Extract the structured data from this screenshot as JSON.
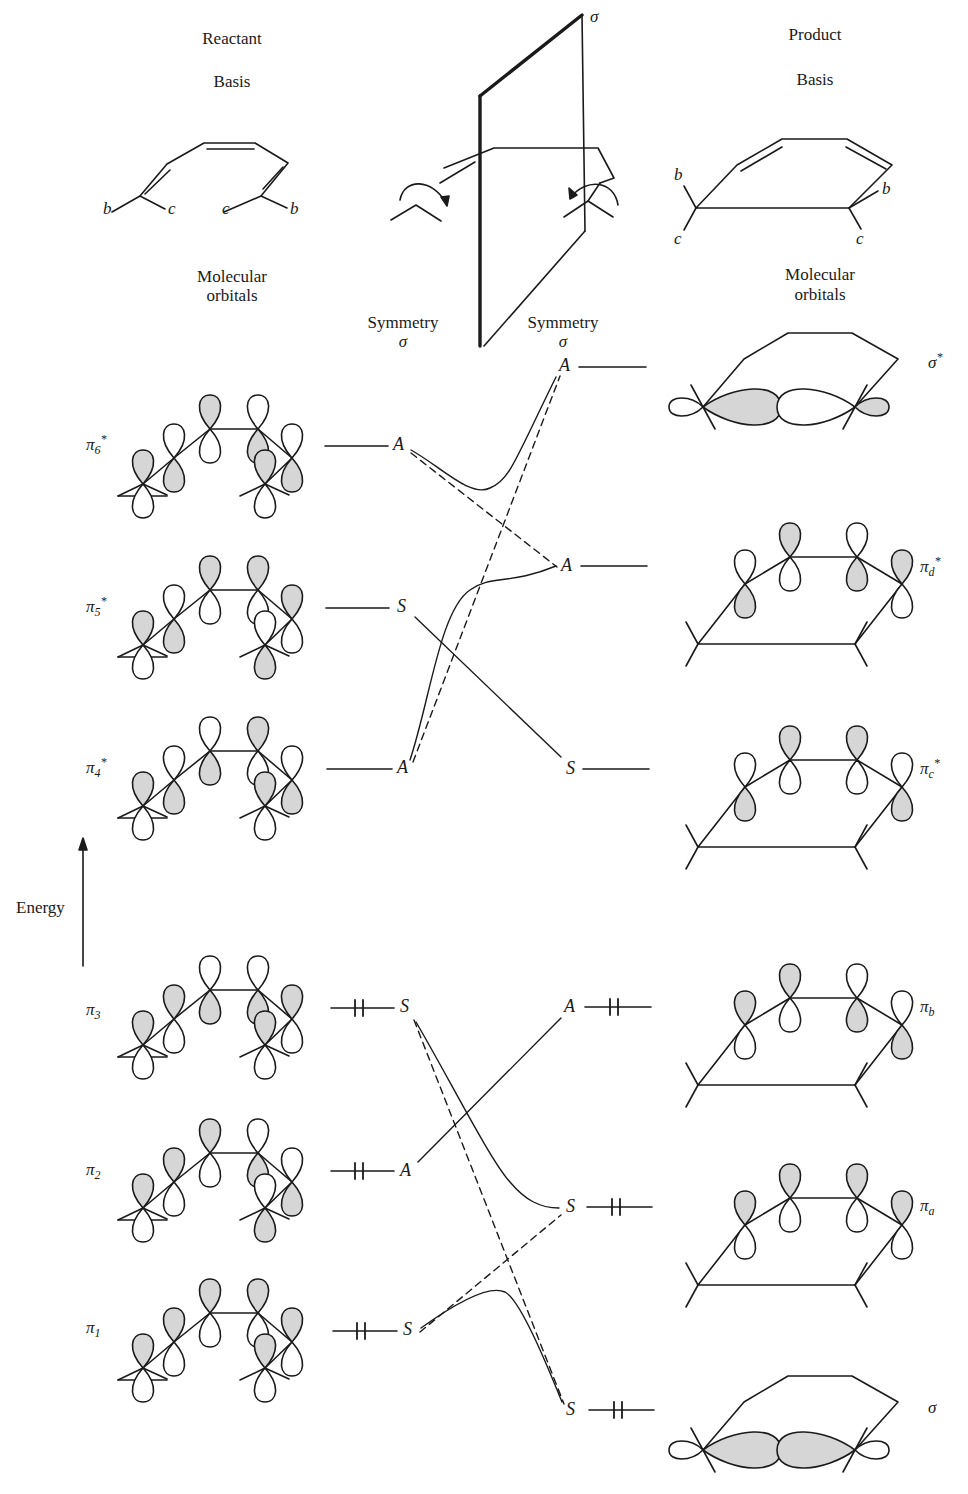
{
  "headers": {
    "reactant_title": "Reactant",
    "reactant_basis": "Basis",
    "reactant_mo_line1": "Molecular",
    "reactant_mo_line2": "orbitals",
    "product_title": "Product",
    "product_basis": "Basis",
    "product_mo_line1": "Molecular",
    "product_mo_line2": "orbitals",
    "symmetry_left": "Symmetry",
    "symmetry_left_sym": "σ",
    "symmetry_right": "Symmetry",
    "symmetry_right_sym": "σ",
    "mirror_plane_label": "σ",
    "energy_label": "Energy"
  },
  "basis_labels": {
    "reactant": [
      "b",
      "c",
      "c",
      "b"
    ],
    "product": [
      "b",
      "c",
      "b",
      "c"
    ]
  },
  "reactant_orbitals": [
    {
      "id": "pi6",
      "base": "π",
      "sub": "6",
      "sup": "*",
      "symmetry": "A",
      "electrons": "",
      "y": 446,
      "shade_top": [
        true,
        false,
        true,
        false,
        false,
        true
      ],
      "label_y": 446
    },
    {
      "id": "pi5",
      "base": "π",
      "sub": "5",
      "sup": "*",
      "symmetry": "S",
      "electrons": "",
      "y": 607,
      "shade_top": [
        true,
        false,
        true,
        true,
        true,
        false
      ]
    },
    {
      "id": "pi4",
      "base": "π",
      "sub": "4",
      "sup": "*",
      "symmetry": "A",
      "electrons": "",
      "y": 768,
      "shade_top": [
        true,
        false,
        false,
        true,
        false,
        true
      ]
    },
    {
      "id": "pi3",
      "base": "π",
      "sub": "3",
      "sup": "",
      "symmetry": "S",
      "electrons": "↑↓",
      "y": 1007,
      "shade_top": [
        true,
        true,
        false,
        false,
        true,
        true
      ]
    },
    {
      "id": "pi2",
      "base": "π",
      "sub": "2",
      "sup": "",
      "symmetry": "A",
      "electrons": "↑↓",
      "y": 1170,
      "shade_top": [
        true,
        true,
        true,
        false,
        false,
        false
      ]
    },
    {
      "id": "pi1",
      "base": "π",
      "sub": "1",
      "sup": "",
      "symmetry": "S",
      "electrons": "↑↓",
      "y": 1330,
      "shade_top": [
        true,
        true,
        true,
        true,
        true,
        true
      ]
    }
  ],
  "product_orbitals": [
    {
      "id": "sigma_star",
      "base": "σ",
      "sub": "",
      "sup": "*",
      "symmetry": "A",
      "electrons": "",
      "y": 367,
      "kind": "sigma-star"
    },
    {
      "id": "pi_d_star",
      "base": "π",
      "sub": "d",
      "sup": "*",
      "symmetry": "A",
      "electrons": "",
      "y": 566,
      "kind": "pi",
      "shade_top": [
        false,
        true,
        false,
        true
      ]
    },
    {
      "id": "pi_c_star",
      "base": "π",
      "sub": "c",
      "sup": "*",
      "symmetry": "S",
      "electrons": "",
      "y": 769,
      "kind": "pi",
      "shade_top": [
        false,
        true,
        true,
        false
      ]
    },
    {
      "id": "pi_b",
      "base": "π",
      "sub": "b",
      "sup": "",
      "symmetry": "A",
      "electrons": "↑↓",
      "y": 1007,
      "kind": "pi",
      "shade_top": [
        true,
        true,
        false,
        false
      ]
    },
    {
      "id": "pi_a",
      "base": "π",
      "sub": "a",
      "sup": "",
      "symmetry": "S",
      "electrons": "↑↓",
      "y": 1207,
      "kind": "pi",
      "shade_top": [
        true,
        true,
        true,
        true
      ]
    },
    {
      "id": "sigma",
      "base": "σ",
      "sub": "",
      "sup": "",
      "symmetry": "S",
      "electrons": "↑↓",
      "y": 1410,
      "kind": "sigma"
    }
  ],
  "correlations": [
    {
      "from": "pi6",
      "to": "pi_d_star",
      "style": "solid-avoided",
      "note": "A→A (avoided crossing)"
    },
    {
      "from": "pi4",
      "to": "sigma_star",
      "style": "solid-avoided",
      "note": "A→A"
    },
    {
      "from": "pi6",
      "to": "pi_d_star",
      "style": "dashed",
      "note": "intended correlation"
    },
    {
      "from": "pi4",
      "to": "sigma_star",
      "style": "dashed",
      "note": "intended correlation"
    },
    {
      "from": "pi5",
      "to": "pi_c_star",
      "style": "solid",
      "note": "S→S"
    },
    {
      "from": "pi2",
      "to": "pi_b",
      "style": "solid",
      "note": "A→A"
    },
    {
      "from": "pi3",
      "to": "pi_a",
      "style": "solid-avoided",
      "note": "S→S"
    },
    {
      "from": "pi1",
      "to": "sigma",
      "style": "solid-avoided",
      "note": "S→S"
    },
    {
      "from": "pi3",
      "to": "sigma",
      "style": "dashed",
      "note": "intended correlation"
    },
    {
      "from": "pi1",
      "to": "pi_a",
      "style": "dashed",
      "note": "intended correlation"
    }
  ],
  "colors": {
    "ink": "#1a1a1a",
    "shade": "#d6d6d6",
    "paper": "#ffffff"
  }
}
